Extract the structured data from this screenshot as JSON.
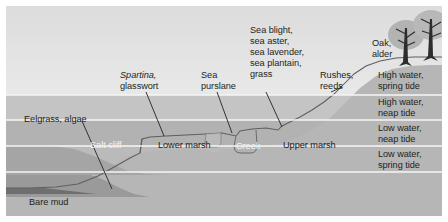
{
  "diagram": {
    "type": "cross-section",
    "vegetation_labels": [
      {
        "id": "eelgrass",
        "text": "Eelgrass, algae",
        "x": 24,
        "y": 114
      },
      {
        "id": "spartina",
        "text": "Spartina,",
        "text2": "glasswort",
        "x": 120,
        "y": 70
      },
      {
        "id": "sea-purslane",
        "text": "Sea",
        "text2": "purslane",
        "x": 201,
        "y": 70
      },
      {
        "id": "sea-blight",
        "text": "Sea blight,",
        "text2": "sea aster,",
        "text3": "sea lavender,",
        "text4": "sea plantain,",
        "text5": "grass",
        "x": 250,
        "y": 25
      },
      {
        "id": "rushes",
        "text": "Rushes,",
        "text2": "reeds",
        "x": 320,
        "y": 70
      },
      {
        "id": "oak-alder",
        "text": "Oak,",
        "text2": "alder",
        "x": 372,
        "y": 38
      },
      {
        "id": "bare-mud",
        "text": "Bare mud",
        "x": 29,
        "y": 197
      }
    ],
    "zone_labels": [
      {
        "id": "salt-cliff",
        "text": "Salt cliff",
        "x": 90,
        "y": 142,
        "style": "white"
      },
      {
        "id": "lower-marsh",
        "text": "Lower marsh",
        "x": 160,
        "y": 142,
        "style": "dark"
      },
      {
        "id": "creek",
        "text": "Creek",
        "x": 240,
        "y": 143,
        "style": "white"
      },
      {
        "id": "upper-marsh",
        "text": "Upper marsh",
        "x": 285,
        "y": 142,
        "style": "dark"
      }
    ],
    "tide_levels": [
      {
        "id": "high-water-spring",
        "line1": "High water,",
        "line2": "spring tide",
        "y": 70
      },
      {
        "id": "high-water-neap",
        "line1": "High water,",
        "line2": "neap tide",
        "y": 97
      },
      {
        "id": "low-water-neap",
        "line1": "Low water,",
        "line2": "neap tide",
        "y": 123
      },
      {
        "id": "low-water-spring",
        "line1": "Low water,",
        "line2": "spring tide",
        "y": 149
      }
    ],
    "colors": {
      "sky_top": "#c9c9c9",
      "sky_bottom": "#f4f4f4",
      "band_1": "#ececec",
      "band_2": "#c2c2c2",
      "band_3": "#b0b0b0",
      "band_4": "#b9b9b9",
      "band_5": "#c6c6c6",
      "land": "#b7b7b7",
      "mud_dark": "#8f8f8f",
      "outline": "#6d6d6d",
      "tree": "#b0b0b0",
      "trunk": "#2b2b2b",
      "leader": "#2b2b2b"
    }
  }
}
